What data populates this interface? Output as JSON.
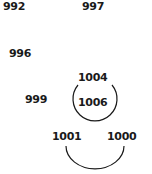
{
  "diagram": {
    "labels": [
      {
        "id": "n992",
        "text": "992"
      },
      {
        "id": "n997",
        "text": "997"
      },
      {
        "id": "n996",
        "text": "996"
      },
      {
        "id": "n1004",
        "text": "1004"
      },
      {
        "id": "n999",
        "text": "999"
      },
      {
        "id": "n1006",
        "text": "1006"
      },
      {
        "id": "n1001",
        "text": "1001"
      },
      {
        "id": "n1000",
        "text": "1000"
      }
    ],
    "arcs": [
      {
        "name": "upper-arc",
        "encloses": [
          "1004",
          "1006"
        ]
      },
      {
        "name": "lower-arc",
        "connects": [
          "1001",
          "1000"
        ]
      }
    ],
    "stroke_color": "#1a1a1a"
  }
}
